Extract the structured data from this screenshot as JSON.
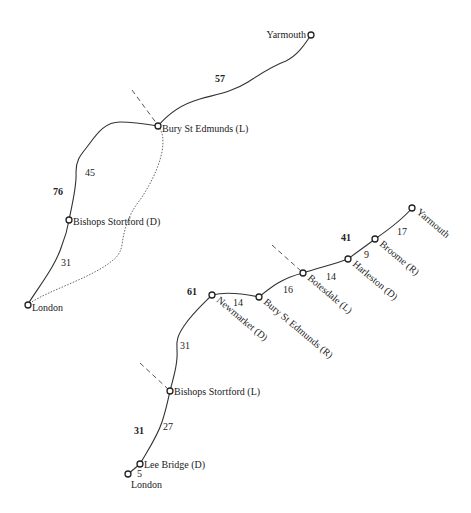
{
  "diagram_upper": {
    "stations": {
      "yarmouth": "Yarmouth",
      "bury": "Bury St Edmunds (L)",
      "bishops": "Bishops Stortford (D)",
      "london": "London"
    },
    "totals": {
      "bury_yarmouth": "57",
      "london_bury": "76"
    },
    "segments": {
      "bishops_bury": "45",
      "london_bishops": "31"
    }
  },
  "diagram_lower": {
    "stations": {
      "yarmouth": "Yarmouth",
      "broome": "Broome (R)",
      "harleston": "Harleston (D)",
      "botesdale": "Botesdale (L)",
      "bury": "Bury St Edmunds (R)",
      "newmarket": "Newmarket (D)",
      "bishops": "Bishops Stortford (L)",
      "lee_bridge": "Lee Bridge (D)",
      "london": "London"
    },
    "totals": {
      "botesdale_yarmouth": "41",
      "bishops_botesdale": "61",
      "london_bishops": "31"
    },
    "segments": {
      "broome_yarmouth": "17",
      "harleston_broome": "9",
      "botesdale_harleston": "14",
      "bury_botesdale": "16",
      "newmarket_bury": "14",
      "bishops_newmarket": "31",
      "lee_bishops": "27",
      "london_lee": "5"
    }
  },
  "colors": {
    "line": "#333333",
    "text": "#222222",
    "background": "#ffffff"
  }
}
